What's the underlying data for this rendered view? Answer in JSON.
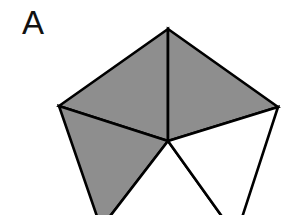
{
  "panel_label": "A",
  "figure": {
    "colors": {
      "shaded": "#8e8e8e",
      "unshaded": "#ffffff",
      "stroke": "#000000"
    },
    "vertices": {
      "top": [
        168,
        29
      ],
      "right": [
        278,
        107
      ],
      "bottom_right": [
        236,
        236
      ],
      "bottom_left": [
        101,
        228
      ],
      "left": [
        59,
        106
      ],
      "center": [
        168,
        141
      ]
    },
    "triangles": [
      {
        "name": "top-left",
        "shaded": true
      },
      {
        "name": "top-right",
        "shaded": true
      },
      {
        "name": "lower-left",
        "shaded": true
      },
      {
        "name": "bottom",
        "shaded": false
      },
      {
        "name": "lower-right",
        "shaded": false
      }
    ],
    "shaded_count": 3,
    "total_triangles": 5
  }
}
